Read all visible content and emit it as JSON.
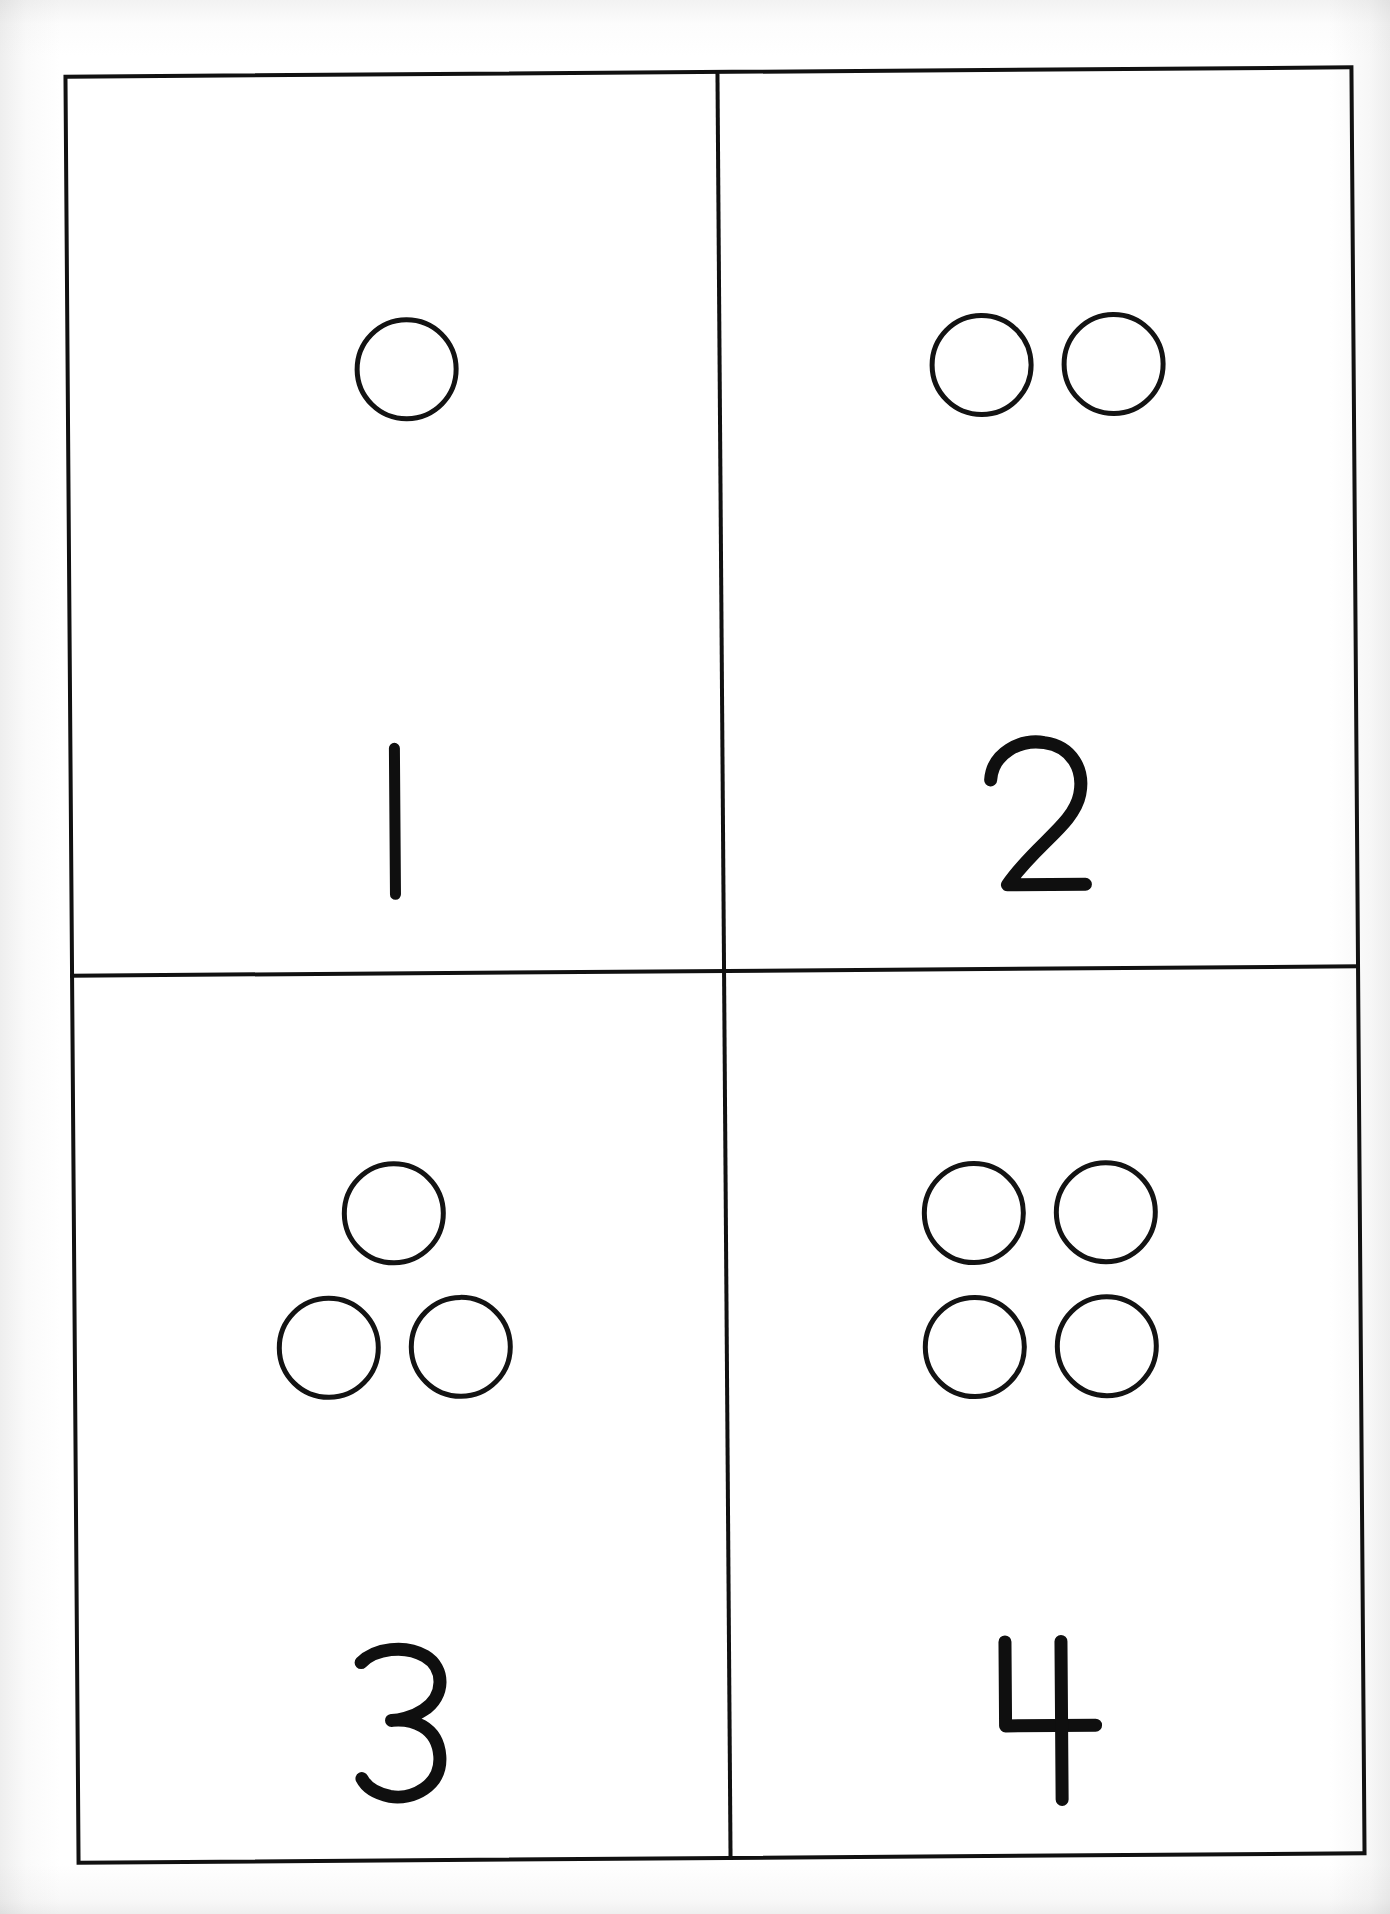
{
  "document": {
    "title": "Counting Cards 1-4",
    "kind": "number-flashcard-worksheet",
    "orientation": "portrait",
    "background_color": "#ffffff",
    "ink_color": "#111111",
    "grid": {
      "rows": 2,
      "columns": 2,
      "border_width_px": 4,
      "divider_color": "#111111"
    }
  },
  "cards": [
    {
      "position": "top-left",
      "numeral": "1",
      "dot_count": 1,
      "dot_layout": "single",
      "dot_shape": "circle-outline",
      "dot_color": "#131313"
    },
    {
      "position": "top-right",
      "numeral": "2",
      "dot_count": 2,
      "dot_layout": "horizontal-pair",
      "dot_shape": "circle-outline",
      "dot_color": "#131313"
    },
    {
      "position": "bottom-left",
      "numeral": "3",
      "dot_count": 3,
      "dot_layout": "triangle",
      "dot_shape": "circle-outline",
      "dot_color": "#131313"
    },
    {
      "position": "bottom-right",
      "numeral": "4",
      "dot_count": 4,
      "dot_layout": "two-by-two-square",
      "dot_shape": "circle-outline",
      "dot_color": "#131313"
    }
  ]
}
